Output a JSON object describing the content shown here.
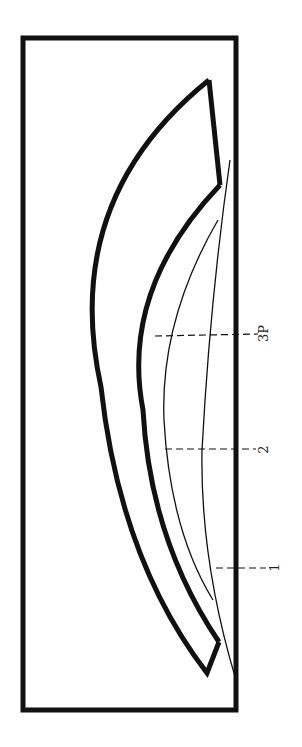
{
  "diagram": {
    "colors": {
      "line": "#111111",
      "background": "#ffffff"
    },
    "labels": [
      {
        "id": "3P",
        "text": "3P"
      },
      {
        "id": "2",
        "text": "2"
      },
      {
        "id": "1",
        "text": "1"
      }
    ]
  }
}
